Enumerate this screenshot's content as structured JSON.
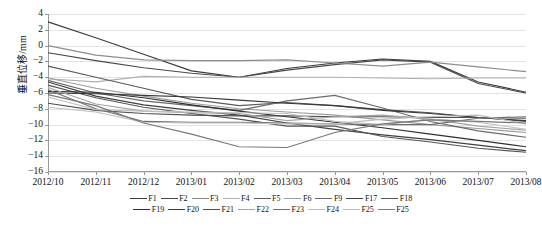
{
  "chart_data": {
    "type": "line",
    "title": "",
    "xlabel": "",
    "ylabel": "垂直位移/mm",
    "ylim": [
      -16,
      4
    ],
    "yticks": [
      4,
      2,
      0,
      -2,
      -4,
      -6,
      -8,
      -10,
      -12,
      -14,
      -16
    ],
    "ytick_labels": [
      "4",
      "2",
      "0",
      "−2",
      "−4",
      "−6",
      "−8",
      "−10",
      "−12",
      "−14",
      "−16"
    ],
    "grid": true,
    "legend_position": "bottom",
    "categories": [
      "2012/10",
      "2012/11",
      "2012/12",
      "2013/01",
      "2013/02",
      "2013/03",
      "2013/04",
      "2013/05",
      "2013/06",
      "2013/07",
      "2013/08"
    ],
    "x": [
      "2012/10",
      "2012/11",
      "2012/12",
      "2013/01",
      "2013/02",
      "2013/03",
      "2013/04",
      "2013/05",
      "2013/06",
      "2013/07",
      "2013/08"
    ],
    "series": [
      {
        "name": "F1",
        "color": "#3a3a3a",
        "values": [
          3.0,
          1.0,
          -1.1,
          -3.2,
          -4.0,
          -2.9,
          -2.2,
          -1.7,
          -2.0,
          -4.6,
          -5.9
        ]
      },
      {
        "name": "F2",
        "color": "#4a4a4a",
        "values": [
          -0.9,
          -1.9,
          -2.8,
          -3.5,
          -4.0,
          -3.1,
          -2.4,
          -1.8,
          -2.1,
          -4.8,
          -6.0
        ]
      },
      {
        "name": "F3",
        "color": "#8d8d8d",
        "values": [
          0.0,
          -1.2,
          -1.8,
          -1.9,
          -1.9,
          -1.8,
          -2.2,
          -2.6,
          -2.1,
          -2.7,
          -3.3
        ]
      },
      {
        "name": "F4",
        "color": "#b0b0b0",
        "values": [
          -4.2,
          -4.6,
          -3.9,
          -4.0,
          -4.0,
          -4.0,
          -4.0,
          -4.1,
          -4.2,
          -4.1,
          -4.1
        ]
      },
      {
        "name": "F5",
        "color": "#5a5a5a",
        "values": [
          -2.6,
          -4.0,
          -5.4,
          -6.8,
          -7.6,
          -7.2,
          -7.6,
          -8.1,
          -8.5,
          -9.1,
          -9.6
        ]
      },
      {
        "name": "F6",
        "color": "#9b9b9b",
        "values": [
          -4.1,
          -5.4,
          -6.4,
          -7.3,
          -8.0,
          -8.4,
          -8.8,
          -9.4,
          -10.0,
          -10.5,
          -11.0
        ]
      },
      {
        "name": "F9",
        "color": "#6a6a6a",
        "values": [
          -4.4,
          -6.0,
          -7.0,
          -7.6,
          -8.2,
          -7.0,
          -6.3,
          -7.9,
          -9.6,
          -10.8,
          -11.6
        ]
      },
      {
        "name": "F17",
        "color": "#404040",
        "values": [
          -4.6,
          -6.4,
          -7.5,
          -8.2,
          -8.8,
          -9.8,
          -10.6,
          -11.3,
          -11.9,
          -12.6,
          -13.3
        ]
      },
      {
        "name": "F18",
        "color": "#555555",
        "values": [
          -5.0,
          -6.6,
          -7.8,
          -8.6,
          -9.3,
          -10.2,
          -10.2,
          -11.5,
          -12.2,
          -13.0,
          -13.5
        ]
      },
      {
        "name": "F19",
        "color": "#2f2f2f",
        "values": [
          -5.8,
          -5.9,
          -6.6,
          -7.5,
          -8.3,
          -9.0,
          -9.7,
          -10.4,
          -11.2,
          -12.0,
          -12.8
        ]
      },
      {
        "name": "F20",
        "color": "#383838",
        "values": [
          -6.0,
          -6.1,
          -6.3,
          -6.5,
          -6.9,
          -7.3,
          -7.6,
          -8.2,
          -8.6,
          -9.1,
          -9.5
        ]
      },
      {
        "name": "F21",
        "color": "#4f4f4f",
        "values": [
          -7.3,
          -8.2,
          -8.6,
          -8.8,
          -8.9,
          -8.9,
          -9.0,
          -9.0,
          -9.1,
          -9.1,
          -9.2
        ]
      },
      {
        "name": "F22",
        "color": "#a5a5a5",
        "values": [
          -5.3,
          -7.4,
          -8.3,
          -8.5,
          -8.6,
          -9.5,
          -9.0,
          -8.8,
          -9.3,
          -10.2,
          -10.7
        ]
      },
      {
        "name": "F23",
        "color": "#707070",
        "values": [
          -5.6,
          -8.0,
          -9.6,
          -9.7,
          -9.7,
          -9.8,
          -9.9,
          -10.0,
          -10.0,
          -9.2,
          -9.0
        ]
      },
      {
        "name": "F24",
        "color": "#c0c0c0",
        "values": [
          -6.5,
          -8.1,
          -8.3,
          -8.4,
          -8.5,
          -8.6,
          -9.6,
          -10.0,
          -9.3,
          -9.7,
          -10.6
        ]
      },
      {
        "name": "F25",
        "color": "#bdbdbd",
        "values": [
          -7.8,
          -8.4,
          -9.7,
          -9.8,
          -9.8,
          -9.9,
          -9.9,
          -9.3,
          -9.0,
          -8.8,
          -9.9
        ]
      },
      {
        "name": "F25",
        "color": "#787878",
        "values": [
          -6.2,
          -7.6,
          -9.8,
          -11.2,
          -12.8,
          -12.9,
          -11.0,
          -9.9,
          -9.4,
          -9.6,
          -9.8
        ]
      }
    ]
  },
  "legend": {
    "row1": [
      "F1",
      "F2",
      "F3",
      "F4",
      "F5",
      "F6",
      "F9",
      "F17",
      "F18"
    ],
    "row2": [
      "F19",
      "F20",
      "F21",
      "F22",
      "F23",
      "F24",
      "F25",
      "F25"
    ]
  },
  "caption": ""
}
